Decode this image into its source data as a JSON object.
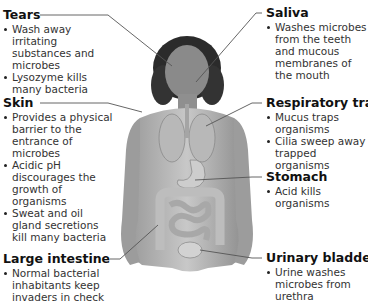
{
  "diagram": {
    "figure_icon": "human-body-anatomy-illustration",
    "line_color": "#555555",
    "labels": [
      {
        "id": "tears",
        "title": "Tears",
        "bullets": [
          "Wash away irritating substances and microbes",
          "Lysozyme kills many bacteria"
        ]
      },
      {
        "id": "skin",
        "title": "Skin",
        "bullets": [
          "Provides a physical barrier to the entrance of microbes",
          "Acidic pH discourages the growth of organisms",
          "Sweat and oil gland secretions kill many bacteria"
        ]
      },
      {
        "id": "large-intestine",
        "title": "Large intestine",
        "bullets": [
          "Normal bacterial inhabitants keep invaders in check"
        ]
      },
      {
        "id": "saliva",
        "title": "Saliva",
        "bullets": [
          "Washes microbes from the teeth and mucous membranes of the mouth"
        ]
      },
      {
        "id": "respiratory-tract",
        "title": "Respiratory tract",
        "bullets": [
          "Mucus traps organisms",
          "Cilia sweep away trapped organisms"
        ]
      },
      {
        "id": "stomach",
        "title": "Stomach",
        "bullets": [
          "Acid kills organisms"
        ]
      },
      {
        "id": "urinary-bladder",
        "title": "Urinary bladder",
        "bullets": [
          "Urine washes microbes from urethra"
        ]
      }
    ]
  }
}
